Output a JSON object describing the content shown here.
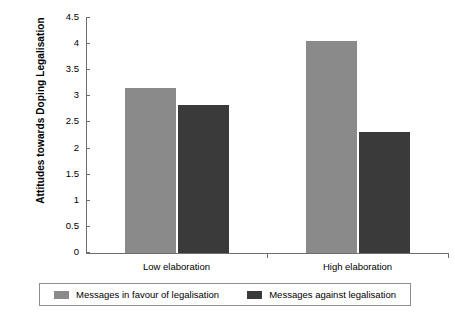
{
  "chart_data": {
    "type": "bar",
    "title": "",
    "xlabel": "",
    "ylabel": "Attitudes towards Doping Legalisation",
    "categories": [
      "Low elaboration",
      "High elaboration"
    ],
    "ylim": [
      0,
      4.5
    ],
    "ytick_labels": [
      "0",
      "0.5",
      "1",
      "1.5",
      "2",
      "2.5",
      "3",
      "3.5",
      "4",
      "4.5"
    ],
    "ytick_values": [
      0,
      0.5,
      1,
      1.5,
      2,
      2.5,
      3,
      3.5,
      4,
      4.5
    ],
    "grid": false,
    "legend_position": "bottom",
    "series": [
      {
        "name": "Messages in favour of legalisation",
        "color": "#8a8a8a",
        "values": [
          3.16,
          4.06
        ]
      },
      {
        "name": "Messages against legalisation",
        "color": "#3a3a3a",
        "values": [
          2.84,
          2.32
        ]
      }
    ]
  },
  "axis": {
    "color": "#6e6e6e"
  },
  "legend": {
    "border_color": "#8d8d8d"
  }
}
